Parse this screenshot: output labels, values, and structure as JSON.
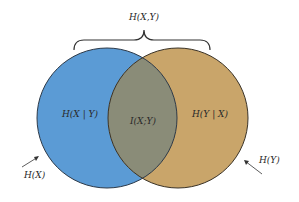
{
  "diagram": {
    "type": "venn",
    "brace_label": "H(X,Y)",
    "sets": [
      {
        "id": "X",
        "label": "H(X)",
        "inner_label": "H(X | Y)",
        "color": "#5b9bd5"
      },
      {
        "id": "Y",
        "label": "H(Y)",
        "inner_label": "H(Y | X)",
        "color": "#c9a56a"
      }
    ],
    "intersection": {
      "label": "I(X;Y)",
      "color": "#8a8c78"
    }
  }
}
